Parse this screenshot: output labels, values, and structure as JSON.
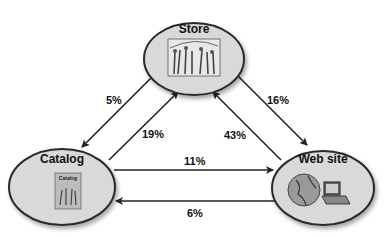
{
  "nodes": {
    "store": {
      "label": "Store",
      "icon": "store-photo-icon"
    },
    "catalog": {
      "label": "Catalog",
      "icon": "catalog-book-icon",
      "inner_label": "Catalog"
    },
    "website": {
      "label": "Web site",
      "icon": "globe-computer-icon"
    }
  },
  "edges": [
    {
      "from": "Store",
      "to": "Catalog",
      "label": "5%"
    },
    {
      "from": "Catalog",
      "to": "Store",
      "label": "19%"
    },
    {
      "from": "Store",
      "to": "Web site",
      "label": "16%"
    },
    {
      "from": "Web site",
      "to": "Store",
      "label": "43%"
    },
    {
      "from": "Catalog",
      "to": "Web site",
      "label": "11%"
    },
    {
      "from": "Web site",
      "to": "Catalog",
      "label": "6%"
    }
  ],
  "colors": {
    "node_fill": "#d9d9d9",
    "node_stroke": "#2a2a2a",
    "arrow": "#222222"
  }
}
